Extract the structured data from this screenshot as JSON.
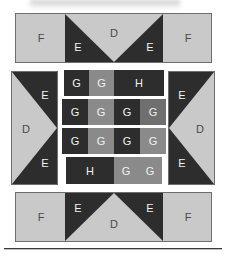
{
  "figure": {
    "title": "",
    "background_color": "#ffffff",
    "palette": {
      "light": "#c9c9c9",
      "dark": "#2d2d2d",
      "mid": "#8a8a8a",
      "mid_dark": "#6f6f6f",
      "outline": "#6e6e6e",
      "label_on_light": "#4a4a4a",
      "label_on_dark": "#f2f2f2",
      "rule": "#3a3a3a"
    }
  },
  "top_strip": {
    "left_patch_label": "F",
    "right_patch_label": "F",
    "center_triangle_label": "D",
    "inner_left_label": "E",
    "inner_right_label": "E"
  },
  "left_panel": {
    "triangle_label": "D",
    "top_label": "E",
    "bottom_label": "E"
  },
  "right_panel": {
    "triangle_label": "D",
    "top_label": "E",
    "bottom_label": "E"
  },
  "center_grid": {
    "rows": [
      {
        "cells": [
          {
            "label": "G",
            "shade": "dark",
            "span": 1
          },
          {
            "label": "G",
            "shade": "mid",
            "span": 1
          },
          {
            "label": "H",
            "shade": "dark",
            "span": 2
          }
        ]
      },
      {
        "cells": [
          {
            "label": "G",
            "shade": "dark",
            "span": 1
          },
          {
            "label": "G",
            "shade": "mid",
            "span": 1
          },
          {
            "label": "G",
            "shade": "dark",
            "span": 1
          },
          {
            "label": "G",
            "shade": "mid_dark",
            "span": 1
          }
        ]
      },
      {
        "cells": [
          {
            "label": "G",
            "shade": "dark",
            "span": 1
          },
          {
            "label": "G",
            "shade": "mid",
            "span": 1
          },
          {
            "label": "G",
            "shade": "dark",
            "span": 1
          },
          {
            "label": "G",
            "shade": "mid",
            "span": 1
          }
        ]
      },
      {
        "cells": [
          {
            "label": "H",
            "shade": "dark",
            "span": 2
          },
          {
            "label": "G",
            "shade": "mid",
            "span": 1
          },
          {
            "label": "G",
            "shade": "mid",
            "span": 1
          }
        ]
      }
    ]
  },
  "bottom_strip": {
    "left_patch_label": "F",
    "right_patch_label": "F",
    "center_triangle_label": "D",
    "inner_left_label": "E",
    "inner_right_label": "E"
  },
  "footer_rule": {
    "visible": true
  }
}
